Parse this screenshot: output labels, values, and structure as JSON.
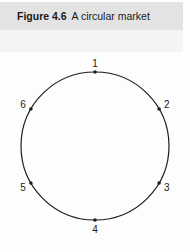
{
  "figure": {
    "number": "Figure 4.6",
    "title": "A circular market"
  },
  "diagram": {
    "shape": "circle",
    "center": [
      95,
      146
    ],
    "radius": 74,
    "stroke_color": "#1e1e1e",
    "points": [
      {
        "label": "1",
        "angle_deg": 90
      },
      {
        "label": "2",
        "angle_deg": 30
      },
      {
        "label": "3",
        "angle_deg": -30
      },
      {
        "label": "4",
        "angle_deg": -90
      },
      {
        "label": "5",
        "angle_deg": -150
      },
      {
        "label": "6",
        "angle_deg": 150
      }
    ]
  }
}
